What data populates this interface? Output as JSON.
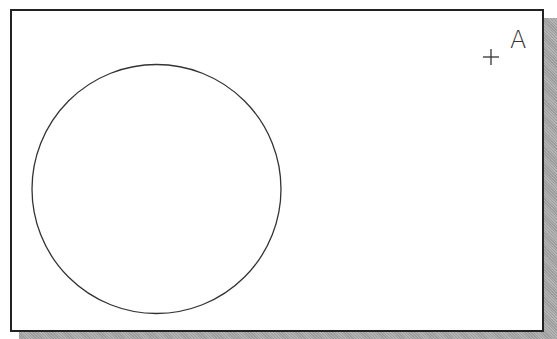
{
  "drawing": {
    "circle": {
      "cx": 156.5,
      "cy": 189,
      "r": 124.5,
      "stroke": "#333333"
    },
    "point_marker": {
      "x": 491,
      "y": 57,
      "size": 8
    },
    "point_label": "A"
  },
  "colors": {
    "frame_border": "#222222",
    "background": "#ffffff",
    "shadow": "#a8a8a8"
  }
}
